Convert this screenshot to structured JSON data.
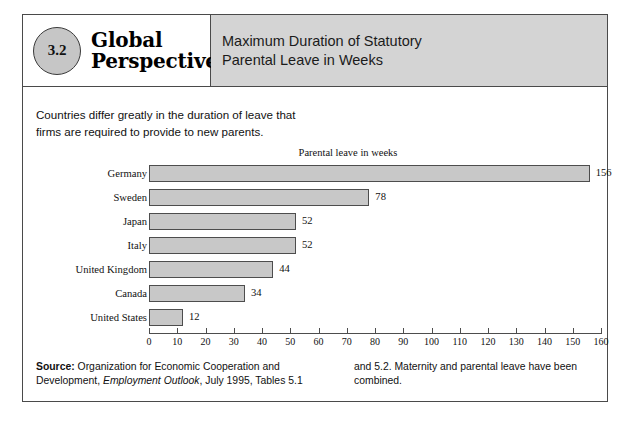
{
  "figure": {
    "number": "3.2",
    "brand_line_1": "Global",
    "brand_line_2": "Perspective",
    "title_line_1": "Maximum Duration of Statutory",
    "title_line_2": "Parental Leave in Weeks"
  },
  "intro": {
    "line_1": "Countries differ greatly in the duration of leave that",
    "line_2": "firms are required to provide to new parents."
  },
  "source": {
    "label": "Source:",
    "left_text_1": " Organization for Economic Cooperation and",
    "left_text_2a": "Development, ",
    "left_italic": "Employment Outlook",
    "left_text_2b": ", July 1995, Tables 5.1",
    "right_text_1": "and 5.2. Maternity and parental leave have been",
    "right_text_2": "combined."
  },
  "chart_data": {
    "type": "bar",
    "orientation": "horizontal",
    "title": "Parental leave in weeks",
    "xlabel": "",
    "ylabel": "",
    "categories": [
      "Germany",
      "Sweden",
      "Japan",
      "Italy",
      "United Kingdom",
      "Canada",
      "United States"
    ],
    "values": [
      156,
      78,
      52,
      52,
      44,
      34,
      12
    ],
    "value_labels": [
      "156",
      "78",
      "52",
      "52",
      "44",
      "34",
      "12"
    ],
    "xlim": [
      0,
      160
    ],
    "xticks": [
      0,
      10,
      20,
      30,
      40,
      50,
      60,
      70,
      80,
      90,
      100,
      110,
      120,
      130,
      140,
      150,
      160
    ],
    "xtick_labels": [
      "0",
      "10",
      "20",
      "30",
      "40",
      "50",
      "60",
      "70",
      "80",
      "90",
      "100",
      "110",
      "120",
      "130",
      "140",
      "150",
      "160"
    ],
    "grid": false,
    "legend": "none",
    "bar_color": "#c8c8c8",
    "bar_border_color": "#4d4d4d"
  },
  "colors": {
    "header_band": "#d4d4d4",
    "badge_fill": "#c6c6c6",
    "frame": "#4a4a4a"
  }
}
